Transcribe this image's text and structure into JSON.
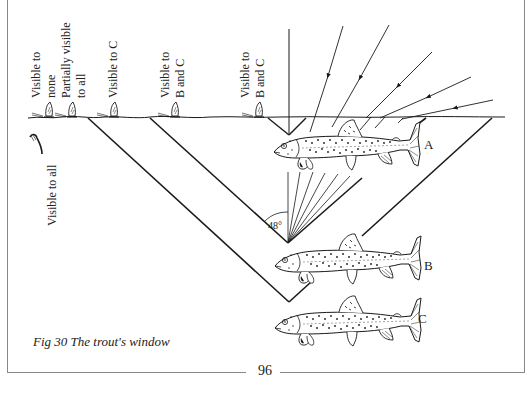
{
  "figure": {
    "caption": "Fig 30 The trout's window",
    "page_number": "96",
    "angle_label": "48°"
  },
  "surface_labels": [
    {
      "lines": [
        "Visible to",
        "none"
      ]
    },
    {
      "lines": [
        "Partially visible",
        "to all"
      ]
    },
    {
      "lines": [
        "Visible to C"
      ]
    },
    {
      "lines": [
        "Visible to",
        "B and C"
      ]
    },
    {
      "lines": [
        "Visible to",
        "B and C"
      ]
    }
  ],
  "underwater_label": "Visible to all",
  "fish": [
    {
      "label": "A"
    },
    {
      "label": "B"
    },
    {
      "label": "C"
    }
  ],
  "colors": {
    "ink": "#1a1a1a",
    "frame": "#888888",
    "paper": "#ffffff"
  }
}
